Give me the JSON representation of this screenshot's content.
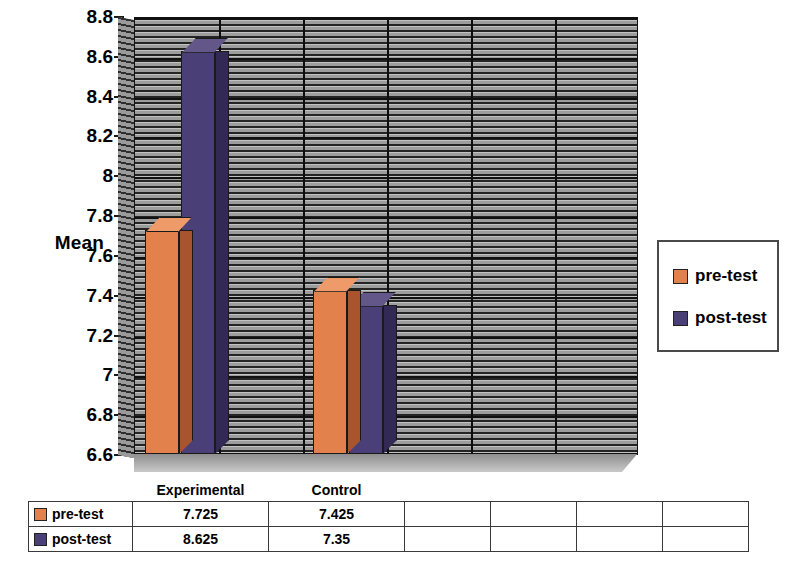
{
  "chart_data": {
    "type": "bar",
    "title": "",
    "xlabel": "",
    "ylabel": "Mean",
    "categories": [
      "Experimental",
      "Control"
    ],
    "series": [
      {
        "name": "pre-test",
        "values": [
          7.725,
          7.425
        ],
        "color": "#E2814C"
      },
      {
        "name": "post-test",
        "values": [
          8.625,
          7.35
        ],
        "color": "#4B3F77"
      }
    ],
    "ylim": [
      6.6,
      8.8
    ],
    "ytick_step": 0.2,
    "yticks": [
      "8.8",
      "8.6",
      "8.4",
      "8.2",
      "8",
      "7.8",
      "7.6",
      "7.4",
      "7.2",
      "7",
      "6.8",
      "6.6"
    ],
    "grid": true,
    "legend_position": "right",
    "style_3d": true
  },
  "axis": {
    "y_label": "Mean",
    "ticks": [
      "8.8",
      "8.6",
      "8.4",
      "8.2",
      "8",
      "7.8",
      "7.6",
      "7.4",
      "7.2",
      "7",
      "6.8",
      "6.6"
    ]
  },
  "legend": {
    "items": [
      {
        "label": "pre-test",
        "color": "#E2814C"
      },
      {
        "label": "post-test",
        "color": "#4B3F77"
      }
    ]
  },
  "table": {
    "header": [
      "",
      "Experimental",
      "Control",
      "",
      "",
      "",
      ""
    ],
    "rows": [
      {
        "key": "pre-test",
        "color": "#E2814C",
        "values": [
          "7.725",
          "7.425",
          "",
          "",
          "",
          ""
        ]
      },
      {
        "key": "post-test",
        "color": "#4B3F77",
        "values": [
          "8.625",
          "7.35",
          "",
          "",
          "",
          ""
        ]
      }
    ]
  },
  "colors": {
    "pre_test": "#E2814C",
    "pre_test_side": "#A9542C",
    "pre_test_top": "#EE9A69",
    "post_test": "#4B3F77",
    "post_test_side": "#322955",
    "post_test_top": "#635689",
    "plot_bg": "#A8A8A8",
    "axis": "#111111"
  }
}
